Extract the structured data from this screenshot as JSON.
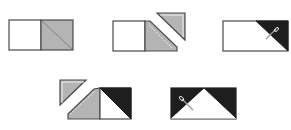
{
  "diagram": {
    "colors": {
      "outline": "#4a4a4a",
      "gray_fabric": "#b4b4b4",
      "dark_fabric": "#1e1e1e",
      "background_fabric": "#ffffff",
      "stitch_line": "#ffffff",
      "needle": "#9a9a9a"
    },
    "steps": [
      {
        "index": 1,
        "label": "Step 1: Place square on rectangle, draw diagonal line"
      },
      {
        "index": 2,
        "label": "Step 2: Stitch on line, trim seam allowance"
      },
      {
        "index": 3,
        "label": "Step 3: Press dark triangle open"
      },
      {
        "index": 4,
        "label": "Step 4: Repeat on opposite end and trim"
      },
      {
        "index": 5,
        "label": "Step 5: Press open to complete flying geese unit"
      }
    ]
  }
}
